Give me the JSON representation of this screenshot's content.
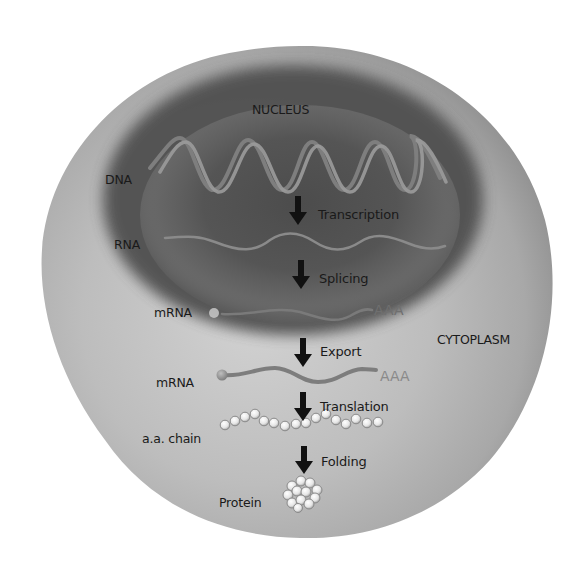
{
  "regions": {
    "nucleus": "NUCLEUS",
    "cytoplasm": "CYTOPLASM"
  },
  "molecules": {
    "dna": "DNA",
    "rna": "RNA",
    "mrna_nuclear": "mRNA",
    "mrna_cytoplasmic": "mRNA",
    "aa_chain": "a.a. chain",
    "protein": "Protein",
    "poly_a_nuclear": "AAA",
    "poly_a_cytoplasmic": "AAA"
  },
  "steps": [
    {
      "label": "Transcription",
      "from": "DNA",
      "to": "RNA"
    },
    {
      "label": "Splicing",
      "from": "RNA",
      "to": "mRNA"
    },
    {
      "label": "Export",
      "from": "mRNA (nucleus)",
      "to": "mRNA (cytoplasm)"
    },
    {
      "label": "Translation",
      "from": "mRNA",
      "to": "a.a. chain"
    },
    {
      "label": "Folding",
      "from": "a.a. chain",
      "to": "Protein"
    }
  ],
  "colors": {
    "background": "#ffffff",
    "cytoplasm": "#b5b5b5",
    "cytoplasm_edge": "#9a9a9a",
    "nucleus": "#5a5a5a",
    "strand": "#8c8c8c",
    "arrow": "#111111",
    "text": "#1a1a1a",
    "poly_a": "#8a8a8a"
  }
}
